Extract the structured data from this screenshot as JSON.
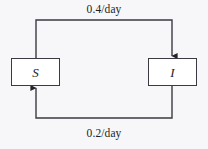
{
  "diagram": {
    "type": "compartmental-flow-diagram",
    "background_color": "#f7f7f9",
    "stroke_color": "#3a3a42",
    "text_color": "#1e1e24",
    "compartments": [
      {
        "id": "susceptible",
        "label": "S",
        "name": "susceptible-compartment"
      },
      {
        "id": "infected",
        "label": "I",
        "name": "infected-compartment"
      }
    ],
    "flows": [
      {
        "id": "infection-flow",
        "from": "S",
        "to": "I",
        "rate_label": "0.4/day",
        "direction": "top",
        "arrowhead": "down-into-infected"
      },
      {
        "id": "recovery-flow",
        "from": "I",
        "to": "S",
        "rate_label": "0.2/day",
        "direction": "bottom",
        "arrowhead": "up-into-susceptible"
      }
    ],
    "labels": {
      "top_rate": "0.4/day",
      "bottom_rate": "0.2/day"
    }
  }
}
